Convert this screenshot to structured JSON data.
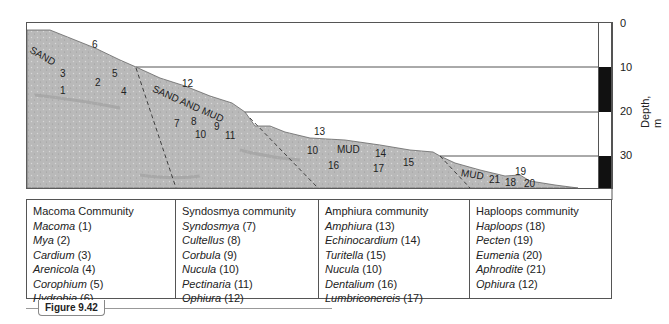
{
  "diagram": {
    "zones": [
      {
        "label": "SAND",
        "x": 32,
        "y": 47,
        "rotate": 30
      },
      {
        "label": "SAND AND MUD",
        "x": 156,
        "y": 93,
        "rotate": 24
      },
      {
        "label": "MUD",
        "x": 336,
        "y": 146,
        "rotate": 0
      },
      {
        "label": "MUD",
        "x": 462,
        "y": 172,
        "rotate": 12
      }
    ],
    "markers": [
      {
        "n": "6",
        "x": 92,
        "y": 40
      },
      {
        "n": "3",
        "x": 60,
        "y": 69
      },
      {
        "n": "5",
        "x": 112,
        "y": 69
      },
      {
        "n": "2",
        "x": 95,
        "y": 78
      },
      {
        "n": "1",
        "x": 60,
        "y": 86
      },
      {
        "n": "4",
        "x": 121,
        "y": 87
      },
      {
        "n": "12",
        "x": 182,
        "y": 79
      },
      {
        "n": "7",
        "x": 174,
        "y": 119
      },
      {
        "n": "8",
        "x": 191,
        "y": 117
      },
      {
        "n": "9",
        "x": 214,
        "y": 122
      },
      {
        "n": "10",
        "x": 195,
        "y": 130
      },
      {
        "n": "11",
        "x": 225,
        "y": 131
      },
      {
        "n": "13",
        "x": 314,
        "y": 127
      },
      {
        "n": "10",
        "x": 307,
        "y": 146
      },
      {
        "n": "14",
        "x": 375,
        "y": 149
      },
      {
        "n": "16",
        "x": 328,
        "y": 161
      },
      {
        "n": "17",
        "x": 373,
        "y": 164
      },
      {
        "n": "15",
        "x": 403,
        "y": 158
      },
      {
        "n": "21",
        "x": 488,
        "y": 175
      },
      {
        "n": "19",
        "x": 514,
        "y": 167
      },
      {
        "n": "18",
        "x": 505,
        "y": 178
      },
      {
        "n": "20",
        "x": 524,
        "y": 179
      }
    ],
    "depth_axis": {
      "title": "Depth, m",
      "ticks": [
        {
          "label": "0",
          "y": 19
        },
        {
          "label": "10",
          "y": 63
        },
        {
          "label": "20",
          "y": 107
        },
        {
          "label": "30",
          "y": 151
        }
      ]
    }
  },
  "table": {
    "columns": [
      {
        "header": "Macoma Community",
        "species": [
          {
            "name": "Macoma",
            "num": " (1)"
          },
          {
            "name": "Mya",
            "num": " (2)"
          },
          {
            "name": "Cardium",
            "num": " (3)"
          },
          {
            "name": "Arenicola",
            "num": " (4)"
          },
          {
            "name": "Corophium",
            "num": " (5)"
          },
          {
            "name": "Hydrobia",
            "num": " (6)"
          }
        ]
      },
      {
        "header": "Syndosmya community",
        "species": [
          {
            "name": "Syndosmya",
            "num": " (7)"
          },
          {
            "name": "Cultellus",
            "num": " (8)"
          },
          {
            "name": "Corbula",
            "num": " (9)"
          },
          {
            "name": "Nucula",
            "num": " (10)"
          },
          {
            "name": "Pectinaria",
            "num": " (11)"
          },
          {
            "name": "Ophiura",
            "num": " (12)"
          }
        ]
      },
      {
        "header": "Amphiura community",
        "species": [
          {
            "name": "Amphiura",
            "num": " (13)"
          },
          {
            "name": "Echinocardium",
            "num": " (14)"
          },
          {
            "name": "Turitella",
            "num": " (15)"
          },
          {
            "name": "Nucula",
            "num": " (10)"
          },
          {
            "name": "Dentalium",
            "num": " (16)"
          },
          {
            "name": "Lumbriconereis",
            "num": " (17)"
          }
        ]
      },
      {
        "header": "Haploops community",
        "species": [
          {
            "name": "Haploops",
            "num": " (18)"
          },
          {
            "name": "Pecten",
            "num": " (19)"
          },
          {
            "name": "Eumenia",
            "num": " (20)"
          },
          {
            "name": "Aphrodite",
            "num": " (21)"
          },
          {
            "name": "Ophiura",
            "num": " (12)"
          }
        ]
      }
    ]
  },
  "figure": {
    "label": "Figure 9.42"
  }
}
